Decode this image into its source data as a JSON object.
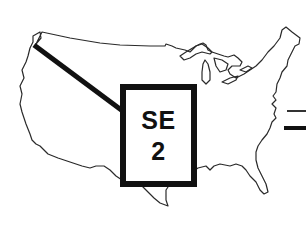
{
  "map": {
    "region": "United States outline",
    "callout": {
      "line1": "SE",
      "line2": "2",
      "pointer_target": "northwest corner (Washington coast)"
    },
    "legend": {
      "items": [
        {
          "style": "thin-line",
          "color": "#333333"
        },
        {
          "style": "thick-line",
          "color": "#111111"
        }
      ]
    },
    "colors": {
      "outline": "#2a2a2a",
      "callout_border": "#111111",
      "background": "#ffffff"
    }
  }
}
